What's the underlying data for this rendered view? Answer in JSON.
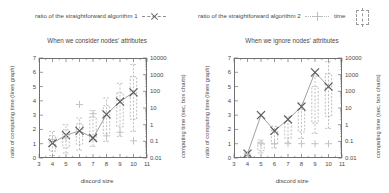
{
  "legend": {
    "items": [
      {
        "label": "ratio of the straightforward algorithm 1",
        "symbol": "x-marker-dashed-line-icon"
      },
      {
        "label": "ratio of the straightforward algorithm 2",
        "symbol": "plus-marker-dotted-line-icon"
      },
      {
        "label": "time",
        "symbol": "box-chart-icon"
      }
    ]
  },
  "axes": {
    "xlabel": "discord size",
    "ylabel_left": "ratio of computing time (lines graph)",
    "ylabel_right": "computing time (sec, box charts)",
    "xticks": [
      "3",
      "4",
      "5",
      "6",
      "7",
      "8",
      "9",
      "10",
      "11"
    ],
    "yticks_left": [
      "0",
      "1",
      "2",
      "3",
      "4",
      "5",
      "6",
      "7"
    ],
    "yticks_right": [
      "0.01",
      "0.1",
      "1",
      "10",
      "100",
      "1000",
      "10000"
    ]
  },
  "chart_data": [
    {
      "type": "line",
      "title": "When we consider nodes' attributes",
      "xlabel": "discord size",
      "ylabel": "ratio of computing time (lines graph)",
      "ylabel_right": "computing time (sec, box charts)",
      "x": [
        4,
        5,
        6,
        7,
        8,
        9,
        10
      ],
      "xlim": [
        3,
        11
      ],
      "ylim": [
        0,
        7
      ],
      "ylim_right": [
        0.01,
        10000
      ],
      "yscale_right": "log",
      "grid": false,
      "legend_position": "top",
      "series": [
        {
          "name": "ratio of the straightforward algorithm 1",
          "marker": "x",
          "values": [
            1.05,
            1.6,
            1.9,
            1.4,
            3.05,
            3.95,
            4.6
          ]
        },
        {
          "name": "ratio of the straightforward algorithm 2",
          "marker": "+",
          "values": [
            1.3,
            1.4,
            3.75,
            3.1,
            1.55,
            1.8,
            1.2
          ]
        }
      ],
      "boxes": [
        {
          "x": 4,
          "low": 0.014,
          "high": 0.4
        },
        {
          "x": 5,
          "low": 0.02,
          "high": 1.0
        },
        {
          "x": 6,
          "low": 0.03,
          "high": 2.5
        },
        {
          "x": 7,
          "low": 0.05,
          "high": 7.0
        },
        {
          "x": 8,
          "low": 0.1,
          "high": 40
        },
        {
          "x": 9,
          "low": 0.2,
          "high": 300
        },
        {
          "x": 10,
          "low": 0.4,
          "high": 4000
        }
      ]
    },
    {
      "type": "line",
      "title": "When we ignore nodes' attributes",
      "xlabel": "discord size",
      "ylabel": "ratio of computing time (lines graph)",
      "ylabel_right": "computing time (sec, box charts)",
      "x": [
        4,
        5,
        6,
        7,
        8,
        9,
        10
      ],
      "xlim": [
        3,
        11
      ],
      "ylim": [
        0,
        7
      ],
      "ylim_right": [
        0.01,
        10000
      ],
      "yscale_right": "log",
      "grid": false,
      "legend_position": "top",
      "series": [
        {
          "name": "ratio of the straightforward algorithm 1",
          "marker": "x",
          "values": [
            0.3,
            3.0,
            1.9,
            2.7,
            3.6,
            6.0,
            5.0
          ]
        },
        {
          "name": "ratio of the straightforward algorithm 2",
          "marker": "+",
          "values": [
            0.25,
            1.0,
            1.0,
            1.0,
            1.0,
            1.0,
            1.0
          ]
        }
      ],
      "boxes": [
        {
          "x": 4,
          "low": 0.012,
          "high": 0.02
        },
        {
          "x": 5,
          "low": 0.02,
          "high": 0.12
        },
        {
          "x": 6,
          "low": 0.04,
          "high": 0.8
        },
        {
          "x": 7,
          "low": 0.08,
          "high": 3.0
        },
        {
          "x": 8,
          "low": 0.15,
          "high": 20
        },
        {
          "x": 9,
          "low": 0.3,
          "high": 800
        },
        {
          "x": 10,
          "low": 0.6,
          "high": 6000
        }
      ]
    }
  ]
}
